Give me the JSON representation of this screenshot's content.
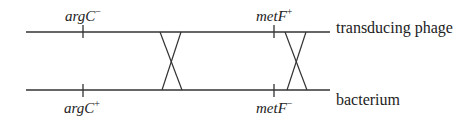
{
  "diagram": {
    "strands": [
      {
        "name": "transducing phage",
        "label": "transducing phage",
        "y": 32
      },
      {
        "name": "bacterium",
        "label": "bacterium",
        "y": 90
      }
    ],
    "genes": {
      "top_left": {
        "base": "argC",
        "allele": "−"
      },
      "bottom_left": {
        "base": "argC",
        "allele": "+"
      },
      "top_right": {
        "base": "metF",
        "allele": "+"
      },
      "bottom_right": {
        "base": "metF",
        "allele": "−"
      }
    },
    "crossovers": [
      {
        "position": "between argC and metF"
      },
      {
        "position": "right of metF"
      }
    ],
    "colors": {
      "line": "#333333",
      "text": "#222222"
    }
  }
}
